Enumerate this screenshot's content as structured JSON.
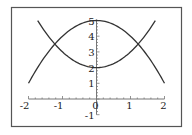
{
  "chart_data": {
    "type": "line",
    "title": "",
    "xlabel": "",
    "ylabel": "",
    "xlim": [
      -2,
      2
    ],
    "ylim": [
      -1,
      5
    ],
    "grid": false,
    "legend": null,
    "x_ticks": [
      "-2",
      "-1",
      "0",
      "1",
      "2"
    ],
    "y_ticks": [
      "-1",
      "1",
      "2",
      "3",
      "4",
      "5"
    ],
    "series": [
      {
        "name": "5 - x^2",
        "x": [
          -2,
          -1.5,
          -1,
          -0.5,
          0,
          0.5,
          1,
          1.5,
          2
        ],
        "y": [
          1,
          2.75,
          4,
          4.75,
          5,
          4.75,
          4,
          2.75,
          1
        ]
      },
      {
        "name": "x^2 + 2",
        "x": [
          -1.73,
          -1.5,
          -1,
          -0.5,
          0,
          0.5,
          1,
          1.5,
          1.73
        ],
        "y": [
          5,
          4.25,
          3,
          2.25,
          2,
          2.25,
          3,
          4.25,
          5
        ]
      }
    ]
  },
  "colors": {
    "frame": "#555555",
    "curve": "#333333",
    "axis": "#777777"
  }
}
